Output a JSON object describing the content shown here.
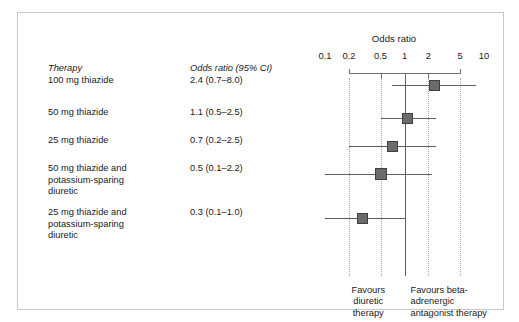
{
  "figure": {
    "axis_title": "Odds ratio",
    "table_headers": {
      "therapy": "Therapy",
      "odds": "Odds ratio (95% CI)"
    },
    "footer_left": "Favours diuretic therapy",
    "footer_left_lines": [
      "Favours",
      "diuretic",
      "therapy"
    ],
    "footer_right": "Favours beta-adrenergic antagonist therapy",
    "footer_right_lines": [
      "Favours beta-",
      "adrenergic",
      "antagonist therapy"
    ],
    "colors": {
      "marker_fill": "#6b6b6b",
      "marker_border": "#3f3f3f",
      "ci_line": "#5e5e5e",
      "axis": "#6d6d6d",
      "gridline": "#a9a9a9",
      "reference_line": "#5e5e5e",
      "frame": "#c8c8c8",
      "text": "#1a1a1a",
      "background": "#ffffff"
    }
  },
  "chart_data": {
    "type": "scatter",
    "subtype": "forest-plot",
    "title": "Odds ratio",
    "xlabel": "Odds ratio",
    "ylabel": "",
    "xscale": "log",
    "xlim": [
      0.1,
      10
    ],
    "ticks": [
      0.1,
      0.2,
      0.5,
      1,
      2,
      5,
      10
    ],
    "tick_labels": [
      "0.1",
      "0.2",
      "0.5",
      "1",
      "2",
      "5",
      "10"
    ],
    "gridlines": [
      0.2,
      0.5,
      2,
      5
    ],
    "reference_line": 1,
    "grid": true,
    "legend": "none",
    "annotations": [
      "Favours diuretic therapy",
      "Favours beta-adrenergic antagonist therapy"
    ],
    "columns": [
      "Therapy",
      "Odds ratio (95% CI)"
    ],
    "rows": [
      {
        "label": "100 mg thiazide",
        "label_lines": [
          "100 mg thiazide"
        ],
        "text": "2.4 (0.7–8.0)",
        "estimate": 2.4,
        "ci_low": 0.7,
        "ci_high": 8.0,
        "marker_size": 11
      },
      {
        "label": "50 mg thiazide",
        "label_lines": [
          "50 mg thiazide"
        ],
        "text": "1.1 (0.5–2.5)",
        "estimate": 1.1,
        "ci_low": 0.5,
        "ci_high": 2.5,
        "marker_size": 11
      },
      {
        "label": "25 mg thiazide",
        "label_lines": [
          "25 mg thiazide"
        ],
        "text": "0.7 (0.2–2.5)",
        "estimate": 0.7,
        "ci_low": 0.2,
        "ci_high": 2.5,
        "marker_size": 11
      },
      {
        "label": "50 mg thiazide and potassium-sparing diuretic",
        "label_lines": [
          "50 mg thiazide and",
          "potassium-sparing",
          "diuretic"
        ],
        "text": "0.5 (0.1–2.2)",
        "estimate": 0.5,
        "ci_low": 0.1,
        "ci_high": 2.2,
        "marker_size": 12
      },
      {
        "label": "25 mg thiazide and potassium-sparing diuretic",
        "label_lines": [
          "25 mg thiazide and",
          "potassium-sparing",
          "diuretic"
        ],
        "text": "0.3 (0.1–1.0)",
        "estimate": 0.3,
        "ci_low": 0.1,
        "ci_high": 1.0,
        "marker_size": 11
      }
    ]
  }
}
